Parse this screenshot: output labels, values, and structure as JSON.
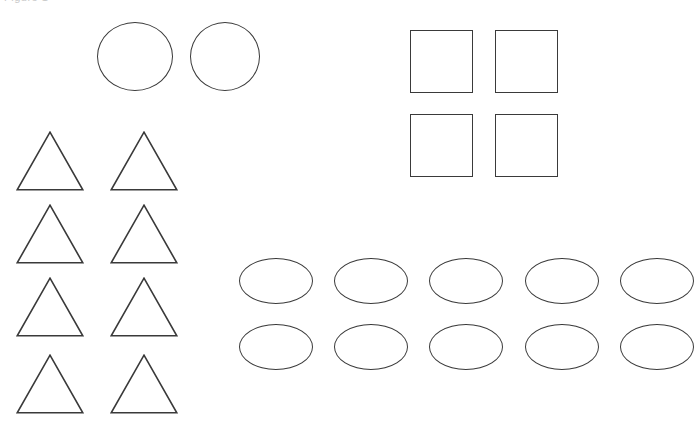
{
  "page": {
    "background_color": "#ffffff",
    "stroke_color": "#3a3a3a",
    "width": 700,
    "height": 427,
    "clipped_header_text": "Figure 1"
  },
  "groups": [
    {
      "id": "circles-group",
      "shape": "circle",
      "count": 2,
      "label": "Circles",
      "items": [
        {
          "name": "circle-1",
          "x": 97,
          "y": 22,
          "w": 76,
          "h": 69
        },
        {
          "name": "circle-2",
          "x": 190,
          "y": 22,
          "w": 70,
          "h": 69
        }
      ]
    },
    {
      "id": "triangles-group",
      "shape": "triangle",
      "count": 8,
      "label": "Triangles",
      "items": [
        {
          "name": "triangle-1",
          "x": 16,
          "y": 131,
          "w": 68,
          "h": 60
        },
        {
          "name": "triangle-2",
          "x": 110,
          "y": 131,
          "w": 68,
          "h": 60
        },
        {
          "name": "triangle-3",
          "x": 16,
          "y": 204,
          "w": 68,
          "h": 60
        },
        {
          "name": "triangle-4",
          "x": 110,
          "y": 204,
          "w": 68,
          "h": 60
        },
        {
          "name": "triangle-5",
          "x": 16,
          "y": 277,
          "w": 68,
          "h": 60
        },
        {
          "name": "triangle-6",
          "x": 110,
          "y": 277,
          "w": 68,
          "h": 60
        },
        {
          "name": "triangle-7",
          "x": 16,
          "y": 354,
          "w": 68,
          "h": 60
        },
        {
          "name": "triangle-8",
          "x": 110,
          "y": 354,
          "w": 68,
          "h": 60
        }
      ]
    },
    {
      "id": "squares-group",
      "shape": "square",
      "count": 4,
      "label": "Squares",
      "items": [
        {
          "name": "square-1",
          "x": 410,
          "y": 30,
          "w": 63,
          "h": 63
        },
        {
          "name": "square-2",
          "x": 495,
          "y": 30,
          "w": 63,
          "h": 63
        },
        {
          "name": "square-3",
          "x": 410,
          "y": 114,
          "w": 63,
          "h": 63
        },
        {
          "name": "square-4",
          "x": 495,
          "y": 114,
          "w": 63,
          "h": 63
        }
      ]
    },
    {
      "id": "ellipses-group",
      "shape": "ellipse",
      "count": 10,
      "label": "Ellipses",
      "items": [
        {
          "name": "ellipse-1",
          "x": 239,
          "y": 258,
          "w": 74,
          "h": 46
        },
        {
          "name": "ellipse-2",
          "x": 334,
          "y": 258,
          "w": 74,
          "h": 46
        },
        {
          "name": "ellipse-3",
          "x": 429,
          "y": 258,
          "w": 74,
          "h": 46
        },
        {
          "name": "ellipse-4",
          "x": 525,
          "y": 258,
          "w": 74,
          "h": 46
        },
        {
          "name": "ellipse-5",
          "x": 620,
          "y": 258,
          "w": 74,
          "h": 46
        },
        {
          "name": "ellipse-6",
          "x": 239,
          "y": 324,
          "w": 74,
          "h": 46
        },
        {
          "name": "ellipse-7",
          "x": 334,
          "y": 324,
          "w": 74,
          "h": 46
        },
        {
          "name": "ellipse-8",
          "x": 429,
          "y": 324,
          "w": 74,
          "h": 46
        },
        {
          "name": "ellipse-9",
          "x": 525,
          "y": 324,
          "w": 74,
          "h": 46
        },
        {
          "name": "ellipse-10",
          "x": 620,
          "y": 324,
          "w": 74,
          "h": 46
        }
      ]
    }
  ]
}
